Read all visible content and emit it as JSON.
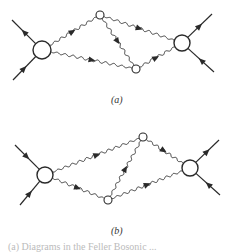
{
  "diagrams": [
    {
      "id": "a",
      "label": "(a)",
      "nodes": [
        {
          "name": "left-vertex",
          "kind": "large"
        },
        {
          "name": "top-vertex",
          "kind": "small"
        },
        {
          "name": "bottom-vertex",
          "kind": "small"
        },
        {
          "name": "right-vertex",
          "kind": "large"
        }
      ],
      "propagators": [
        {
          "from": "left-vertex",
          "to": "top-vertex",
          "style": "wavy",
          "arrow": "forward"
        },
        {
          "from": "left-vertex",
          "to": "bottom-vertex",
          "style": "wavy",
          "arrow": "forward"
        },
        {
          "from": "top-vertex",
          "to": "bottom-vertex",
          "style": "wavy",
          "arrow": "forward"
        },
        {
          "from": "top-vertex",
          "to": "right-vertex",
          "style": "wavy",
          "arrow": "forward"
        },
        {
          "from": "bottom-vertex",
          "to": "right-vertex",
          "style": "wavy",
          "arrow": "forward"
        }
      ],
      "external_lines": [
        {
          "at": "left-vertex",
          "side": "upper-left",
          "arrow": "outward"
        },
        {
          "at": "left-vertex",
          "side": "lower-left",
          "arrow": "inward"
        },
        {
          "at": "right-vertex",
          "side": "upper-right",
          "arrow": "outward"
        },
        {
          "at": "right-vertex",
          "side": "lower-right",
          "arrow": "inward"
        }
      ]
    },
    {
      "id": "b",
      "label": "(b)",
      "nodes": [
        {
          "name": "left-vertex",
          "kind": "large"
        },
        {
          "name": "top-vertex",
          "kind": "small"
        },
        {
          "name": "bottom-vertex",
          "kind": "small"
        },
        {
          "name": "right-vertex",
          "kind": "large"
        }
      ],
      "propagators": [
        {
          "from": "left-vertex",
          "to": "top-vertex",
          "style": "wavy",
          "arrow": "forward"
        },
        {
          "from": "left-vertex",
          "to": "bottom-vertex",
          "style": "wavy",
          "arrow": "forward"
        },
        {
          "from": "bottom-vertex",
          "to": "top-vertex",
          "style": "wavy",
          "arrow": "forward"
        },
        {
          "from": "top-vertex",
          "to": "right-vertex",
          "style": "wavy",
          "arrow": "forward"
        },
        {
          "from": "bottom-vertex",
          "to": "right-vertex",
          "style": "wavy",
          "arrow": "forward"
        }
      ],
      "external_lines": [
        {
          "at": "left-vertex",
          "side": "upper-left",
          "arrow": "inward"
        },
        {
          "at": "left-vertex",
          "side": "lower-left",
          "arrow": "inward"
        },
        {
          "at": "right-vertex",
          "side": "upper-right",
          "arrow": "outward"
        },
        {
          "at": "right-vertex",
          "side": "lower-right",
          "arrow": "inward"
        }
      ]
    }
  ],
  "caption": "(a) Diagrams in the Feller Bosonic ..."
}
